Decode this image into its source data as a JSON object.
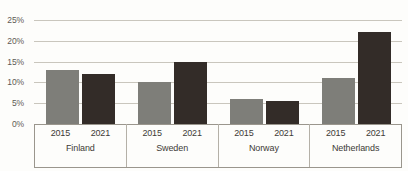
{
  "chart_data": {
    "type": "bar",
    "title": "",
    "xlabel": "",
    "ylabel": "",
    "ylim": [
      0,
      25
    ],
    "ytick_labels": [
      "25%",
      "20%",
      "15%",
      "10%",
      "5%",
      "0%"
    ],
    "ytick_values": [
      25,
      20,
      15,
      10,
      5,
      0
    ],
    "grid": true,
    "legend": "none",
    "categories": [
      "Finland",
      "Sweden",
      "Norway",
      "Netherlands"
    ],
    "series": [
      {
        "name": "2015",
        "color": "#7e7e79",
        "values": [
          13,
          10,
          6,
          11
        ]
      },
      {
        "name": "2021",
        "color": "#332c28",
        "values": [
          12,
          15,
          5.5,
          22
        ]
      }
    ],
    "groups": [
      {
        "category": "Finland",
        "bars": [
          {
            "year": "2015",
            "value": 13,
            "series": "2015"
          },
          {
            "year": "2021",
            "value": 12,
            "series": "2021"
          }
        ]
      },
      {
        "category": "Sweden",
        "bars": [
          {
            "year": "2015",
            "value": 10,
            "series": "2015"
          },
          {
            "year": "2021",
            "value": 15,
            "series": "2021"
          }
        ]
      },
      {
        "category": "Norway",
        "bars": [
          {
            "year": "2015",
            "value": 6,
            "series": "2015"
          },
          {
            "year": "2021",
            "value": 5.5,
            "series": "2021"
          }
        ]
      },
      {
        "category": "Netherlands",
        "bars": [
          {
            "year": "2015",
            "value": 11,
            "series": "2015"
          },
          {
            "year": "2021",
            "value": 22,
            "series": "2021"
          }
        ]
      }
    ]
  },
  "colors": {
    "series_2015": "#7e7e79",
    "series_2021": "#332c28",
    "gridline": "#c9c6bd",
    "axis": "#9a968d",
    "text": "#3d3b37",
    "background": "#fdfdfb"
  }
}
